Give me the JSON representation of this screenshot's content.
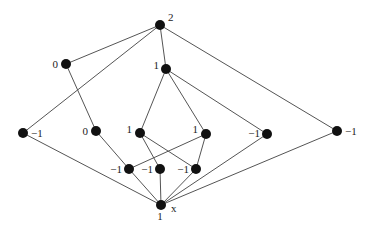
{
  "diagram": {
    "type": "poset-hasse-diagram",
    "width": 369,
    "height": 233,
    "colors": {
      "background": "#ffffff",
      "edge": "#555555",
      "node": "#111111",
      "label": "#222222"
    },
    "node_radius": 5,
    "nodes": [
      {
        "id": "top",
        "x": 160,
        "y": 25,
        "label": "2",
        "label_dx": 8,
        "label_dy": -4,
        "anchor": "start"
      },
      {
        "id": "zero_upper",
        "x": 66,
        "y": 64,
        "label": "0",
        "label_dx": -8,
        "label_dy": 4,
        "anchor": "end"
      },
      {
        "id": "one_upper",
        "x": 166,
        "y": 69,
        "label": "1",
        "label_dx": -7,
        "label_dy": 0,
        "anchor": "end"
      },
      {
        "id": "neg_left",
        "x": 23,
        "y": 133,
        "label": "−1",
        "label_dx": 8,
        "label_dy": 4,
        "anchor": "start"
      },
      {
        "id": "zero_mid",
        "x": 96,
        "y": 131,
        "label": "0",
        "label_dx": -8,
        "label_dy": 4,
        "anchor": "end"
      },
      {
        "id": "one_midl",
        "x": 140,
        "y": 133,
        "label": "1",
        "label_dx": -8,
        "label_dy": 0,
        "anchor": "end"
      },
      {
        "id": "one_midr",
        "x": 206,
        "y": 134,
        "label": "1",
        "label_dx": -8,
        "label_dy": -1,
        "anchor": "end"
      },
      {
        "id": "neg_midr",
        "x": 267,
        "y": 134,
        "label": "−1",
        "label_dx": -7,
        "label_dy": 3,
        "anchor": "end"
      },
      {
        "id": "neg_right",
        "x": 337,
        "y": 131,
        "label": "−1",
        "label_dx": 8,
        "label_dy": 4,
        "anchor": "start"
      },
      {
        "id": "neg_low1",
        "x": 129,
        "y": 169,
        "label": "−1",
        "label_dx": -7,
        "label_dy": 4,
        "anchor": "end"
      },
      {
        "id": "neg_low2",
        "x": 160,
        "y": 169,
        "label": "−1",
        "label_dx": -7,
        "label_dy": 4,
        "anchor": "end"
      },
      {
        "id": "neg_low3",
        "x": 196,
        "y": 169,
        "label": "−1",
        "label_dx": -7,
        "label_dy": 4,
        "anchor": "end"
      },
      {
        "id": "bottom",
        "x": 161,
        "y": 205,
        "label": "1",
        "label_dx": -1,
        "label_dy": 15,
        "anchor": "middle",
        "extra_label": "x",
        "extra_dx": 10,
        "extra_dy": 7
      }
    ],
    "edges": [
      [
        "top",
        "zero_upper"
      ],
      [
        "top",
        "neg_left"
      ],
      [
        "top",
        "one_upper"
      ],
      [
        "top",
        "neg_right"
      ],
      [
        "zero_upper",
        "zero_mid"
      ],
      [
        "one_upper",
        "one_midl"
      ],
      [
        "one_upper",
        "one_midr"
      ],
      [
        "one_upper",
        "neg_midr"
      ],
      [
        "zero_mid",
        "neg_low1"
      ],
      [
        "one_midl",
        "neg_low2"
      ],
      [
        "one_midl",
        "neg_low3"
      ],
      [
        "one_midr",
        "neg_low1"
      ],
      [
        "one_midr",
        "neg_low3"
      ],
      [
        "neg_left",
        "bottom"
      ],
      [
        "neg_low1",
        "bottom"
      ],
      [
        "neg_low2",
        "bottom"
      ],
      [
        "neg_low3",
        "bottom"
      ],
      [
        "neg_midr",
        "bottom"
      ],
      [
        "neg_right",
        "bottom"
      ]
    ]
  }
}
